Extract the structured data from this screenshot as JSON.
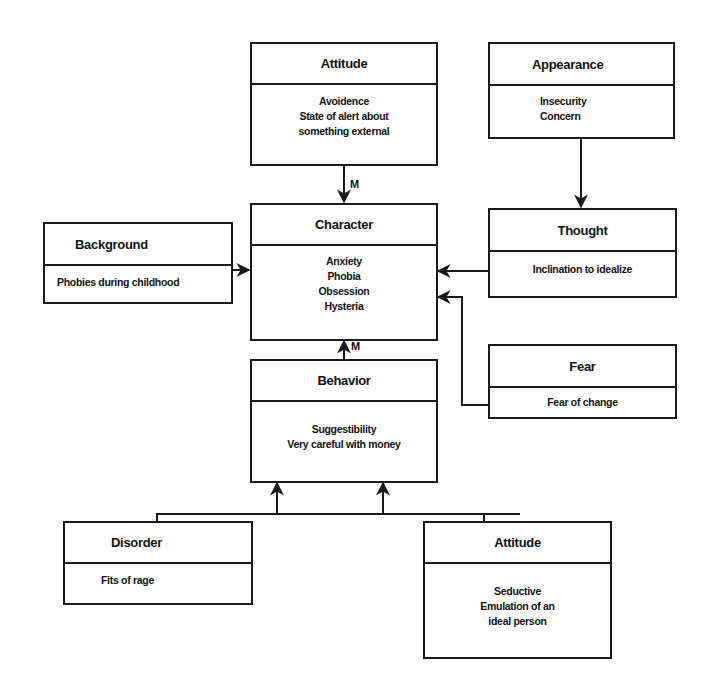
{
  "diagram": {
    "boxes": {
      "attitude_top": {
        "title": "Attitude",
        "lines": [
          "Avoidence",
          "State of alert about",
          "something external"
        ]
      },
      "appearance": {
        "title": "Appearance",
        "lines": [
          "Insecurity",
          "Concern"
        ]
      },
      "background": {
        "title": "Background",
        "lines": [
          "Phobies during childhood"
        ]
      },
      "character": {
        "title": "Character",
        "lines": [
          "Anxiety",
          "Phobia",
          "Obsession",
          "Hysteria"
        ]
      },
      "thought": {
        "title": "Thought",
        "lines": [
          "Inclination to idealize"
        ]
      },
      "fear": {
        "title": "Fear",
        "lines": [
          "Fear of change"
        ]
      },
      "behavior": {
        "title": "Behavior",
        "lines": [
          "Suggestibility",
          "Very careful with money"
        ]
      },
      "disorder": {
        "title": "Disorder",
        "lines": [
          "Fits of rage"
        ]
      },
      "attitude_bottom": {
        "title": "Attitude",
        "lines": [
          "Seductive",
          "Emulation of an",
          "ideal person"
        ]
      }
    },
    "edge_labels": {
      "attitude_to_character": "M",
      "behavior_to_character": "M"
    },
    "edges": [
      {
        "from": "attitude_top",
        "to": "character",
        "label": "M"
      },
      {
        "from": "appearance",
        "to": "thought"
      },
      {
        "from": "background",
        "to": "character"
      },
      {
        "from": "thought",
        "to": "character"
      },
      {
        "from": "fear",
        "to": "character"
      },
      {
        "from": "behavior",
        "to": "character",
        "label": "M"
      },
      {
        "from": "disorder",
        "to": "behavior"
      },
      {
        "from": "attitude_bottom",
        "to": "behavior"
      }
    ]
  }
}
